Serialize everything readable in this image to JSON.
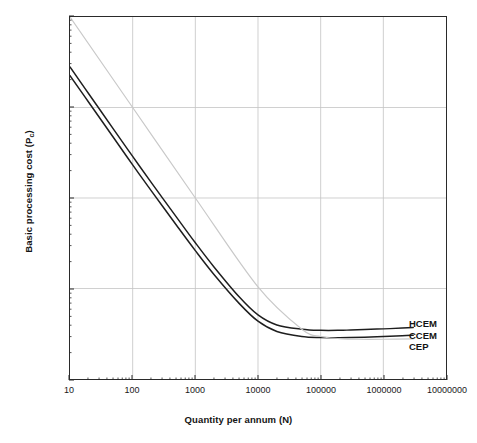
{
  "chart_data": {
    "type": "line",
    "title": "",
    "xlabel": "Quantity per annum (N)",
    "ylabel": "Basic processing cost (Pc)",
    "ylabel_text": "Basic processing cost (P",
    "ylabel_sub": "c",
    "ylabel_tail": ")",
    "xscale": "log",
    "yscale": "log",
    "xlim": [
      10,
      10000000
    ],
    "ylim": [
      1,
      10000
    ],
    "grid": true,
    "legend_position": "right-inline-end-of-series",
    "xticks": [
      "10",
      "100",
      "1000",
      "10000",
      "100000",
      "1000000",
      "10000000"
    ],
    "xtick_values": [
      10,
      100,
      1000,
      10000,
      100000,
      1000000,
      10000000
    ],
    "yticks": [
      "10000",
      "1000",
      "100",
      "10",
      "1"
    ],
    "ytick_values": [
      10000,
      1000,
      100,
      10,
      1
    ],
    "minor_ticks": true,
    "series": [
      {
        "name": "HCEM",
        "color": "#1e1e1e",
        "width": 1.5,
        "x": [
          10,
          20,
          50,
          100,
          200,
          500,
          1000,
          2000,
          5000,
          10000,
          20000,
          50000,
          100000,
          200000,
          300000,
          500000,
          1000000,
          2000000,
          3000000
        ],
        "values": [
          2800,
          1410,
          570,
          288,
          147,
          61.5,
          32.0,
          17.2,
          8.1,
          5.1,
          3.95,
          3.55,
          3.45,
          3.45,
          3.48,
          3.52,
          3.58,
          3.65,
          3.7
        ]
      },
      {
        "name": "CCEM",
        "color": "#1e1e1e",
        "width": 1.5,
        "x": [
          10,
          20,
          50,
          100,
          200,
          500,
          1000,
          2000,
          5000,
          10000,
          20000,
          50000,
          100000,
          200000,
          300000,
          500000,
          1000000,
          2000000,
          3000000
        ],
        "values": [
          2250,
          1135,
          460,
          232,
          119,
          50.0,
          26.2,
          14.2,
          6.85,
          4.35,
          3.35,
          2.95,
          2.87,
          2.86,
          2.87,
          2.9,
          2.95,
          3.0,
          3.05
        ]
      },
      {
        "name": "CEP",
        "color": "#c9c9c9",
        "width": 1.2,
        "x": [
          10,
          100,
          1000,
          10000,
          50000,
          100000,
          200000,
          400000,
          1000000,
          3000000
        ],
        "values": [
          10000,
          1000,
          100,
          10.4,
          3.55,
          2.95,
          2.8,
          2.75,
          2.75,
          2.78
        ]
      }
    ]
  },
  "axes": {
    "x_title": "Quantity per annum (N)",
    "y_title_main": "Basic processing cost (P",
    "y_title_sub": "c",
    "y_title_close": ")"
  },
  "legend": {
    "items": [
      {
        "label": "HCEM"
      },
      {
        "label": "CCEM"
      },
      {
        "label": "CEP"
      }
    ]
  },
  "colors": {
    "frame": "#2a2a2a",
    "grid": "#c4c4c4",
    "series_dark": "#1e1e1e",
    "series_light": "#c9c9c9",
    "text": "#141414",
    "background": "#ffffff"
  }
}
